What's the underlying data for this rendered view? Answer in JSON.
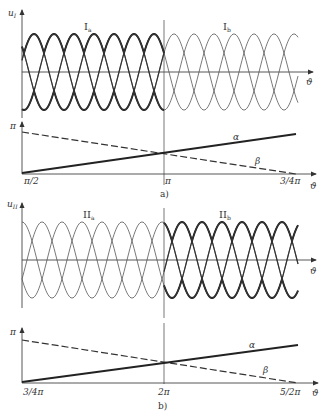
{
  "panels": [
    {
      "id": "a",
      "caption": "a)",
      "y_axis_label": "u",
      "y_axis_sub": "I",
      "x_axis_label": "ϑ",
      "region_left_label": "I",
      "region_left_sub": "a",
      "region_right_label": "I",
      "region_right_sub": "b",
      "lower_y_label": "π",
      "lower_x_label": "ϑ",
      "lower_ticks": [
        "π/2",
        "π",
        "3/4π"
      ],
      "alpha_label": "α",
      "beta_label": "β",
      "thick_side": "left"
    },
    {
      "id": "b",
      "caption": "b)",
      "y_axis_label": "u",
      "y_axis_sub": "II",
      "x_axis_label": "ϑ",
      "region_left_label": "II",
      "region_left_sub": "a",
      "region_right_label": "II",
      "region_right_sub": "b",
      "lower_y_label": "π",
      "lower_x_label": "ϑ",
      "lower_ticks": [
        "3/4π",
        "2π",
        "5/2π"
      ],
      "alpha_label": "α",
      "beta_label": "β",
      "thick_side": "right"
    }
  ],
  "chart_data": [
    {
      "type": "line",
      "title": "a)",
      "upper": {
        "description": "Three-phase sinusoidal voltages u_I, regions I_a (left) and I_b (right), envelope emphasized",
        "xlabel": "ϑ",
        "ylabel": "u_I"
      },
      "lower": {
        "xlabel": "ϑ",
        "ylabel": "π",
        "x_ticks": [
          "π/2",
          "π",
          "3/4π"
        ],
        "series": [
          {
            "name": "α",
            "style": "solid",
            "x": [
              "π/2",
              "π",
              "3/4π"
            ],
            "y_fraction_of_pi": [
              0.0,
              0.5,
              0.95
            ]
          },
          {
            "name": "β",
            "style": "dashed",
            "x": [
              "π/2",
              "π",
              "3/4π"
            ],
            "y_fraction_of_pi": [
              1.0,
              0.5,
              0.0
            ]
          }
        ]
      }
    },
    {
      "type": "line",
      "title": "b)",
      "upper": {
        "description": "Three-phase sinusoidal voltages u_II, regions II_a (left) and II_b (right), envelope emphasized",
        "xlabel": "ϑ",
        "ylabel": "u_II"
      },
      "lower": {
        "xlabel": "ϑ",
        "ylabel": "π",
        "x_ticks": [
          "3/4π",
          "2π",
          "5/2π"
        ],
        "series": [
          {
            "name": "α",
            "style": "solid",
            "x": [
              "3/4π",
              "2π",
              "5/2π"
            ],
            "y_fraction_of_pi": [
              0.0,
              0.5,
              0.95
            ]
          },
          {
            "name": "β",
            "style": "dashed",
            "x": [
              "3/4π",
              "2π",
              "5/2π"
            ],
            "y_fraction_of_pi": [
              1.0,
              0.5,
              0.0
            ]
          }
        ]
      }
    }
  ]
}
